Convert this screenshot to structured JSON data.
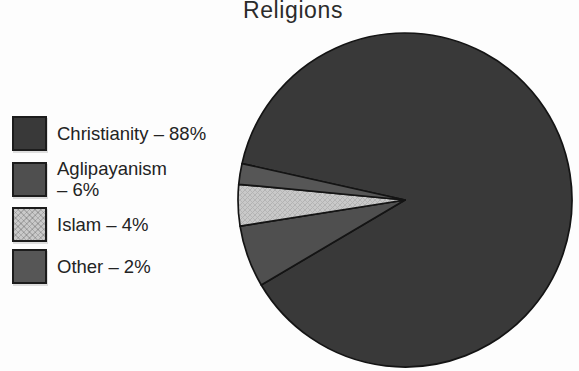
{
  "figure": {
    "title": "Religions"
  },
  "chart_data": {
    "type": "pie",
    "title": "Religions",
    "legend_position": "left",
    "start_angle_deg": 167.4,
    "direction": "clockwise",
    "categories": [
      "Christianity",
      "Aglipayanism",
      "Islam",
      "Other"
    ],
    "values": [
      88,
      6,
      4,
      2
    ],
    "unit": "%",
    "outline_color": "#141414",
    "background": "#fdfdfd",
    "slices": [
      {
        "label": "Christianity",
        "pct": 88,
        "color": "#393939",
        "legend_lines": [
          "Christianity – 88%"
        ]
      },
      {
        "label": "Aglipayanism",
        "pct": 6,
        "color": "#4f4f4f",
        "legend_lines": [
          "Aglipayanism",
          "– 6%"
        ]
      },
      {
        "label": "Islam",
        "pct": 4,
        "color": "#c9c9c9",
        "pattern": "crosshatch",
        "pattern_color": "#b2b2b2",
        "legend_lines": [
          "Islam – 4%"
        ]
      },
      {
        "label": "Other",
        "pct": 2,
        "color": "#565656",
        "legend_lines": [
          "Other – 2%"
        ]
      }
    ]
  }
}
